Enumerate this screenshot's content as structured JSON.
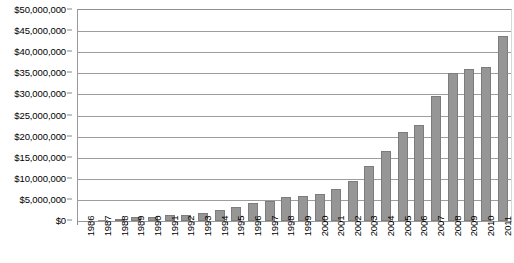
{
  "chart_data": {
    "type": "bar",
    "title": "",
    "subtitle": "",
    "xlabel": "",
    "ylabel": "",
    "ylim": [
      0,
      50000000
    ],
    "ytick_step": 5000000,
    "grid": true,
    "legend": false,
    "orientation": "vertical",
    "bar_color": "#969696",
    "bar_border_color": "#7d7d7d",
    "gridline_color": "#9d9d9d",
    "axis_color": "#8d8d8d",
    "background": "#ffffff",
    "categories": [
      "1986",
      "1987",
      "1988",
      "1989",
      "1990",
      "1991",
      "1992",
      "1993",
      "1994",
      "1995",
      "1996",
      "1997",
      "1998",
      "1999",
      "2000",
      "2001",
      "2002",
      "2003",
      "2004",
      "2005",
      "2006",
      "2007",
      "2008",
      "2009",
      "2010",
      "2011"
    ],
    "values": [
      100000,
      150000,
      400000,
      900000,
      1000000,
      1400000,
      1500000,
      1900000,
      2600000,
      3400000,
      4300000,
      4700000,
      5600000,
      6000000,
      6400000,
      7700000,
      9600000,
      13000000,
      16700000,
      21000000,
      22800000,
      29700000,
      35000000,
      36000000,
      36600000,
      43800000
    ],
    "ytick_labels": [
      "$0",
      "$5,000,000",
      "$10,000,000",
      "$15,000,000",
      "$20,000,000",
      "$25,000,000",
      "$30,000,000",
      "$35,000,000",
      "$40,000,000",
      "$45,000,000",
      "$50,000,000"
    ],
    "ytick_values": [
      0,
      5000000,
      10000000,
      15000000,
      20000000,
      25000000,
      30000000,
      35000000,
      40000000,
      45000000,
      50000000
    ]
  }
}
